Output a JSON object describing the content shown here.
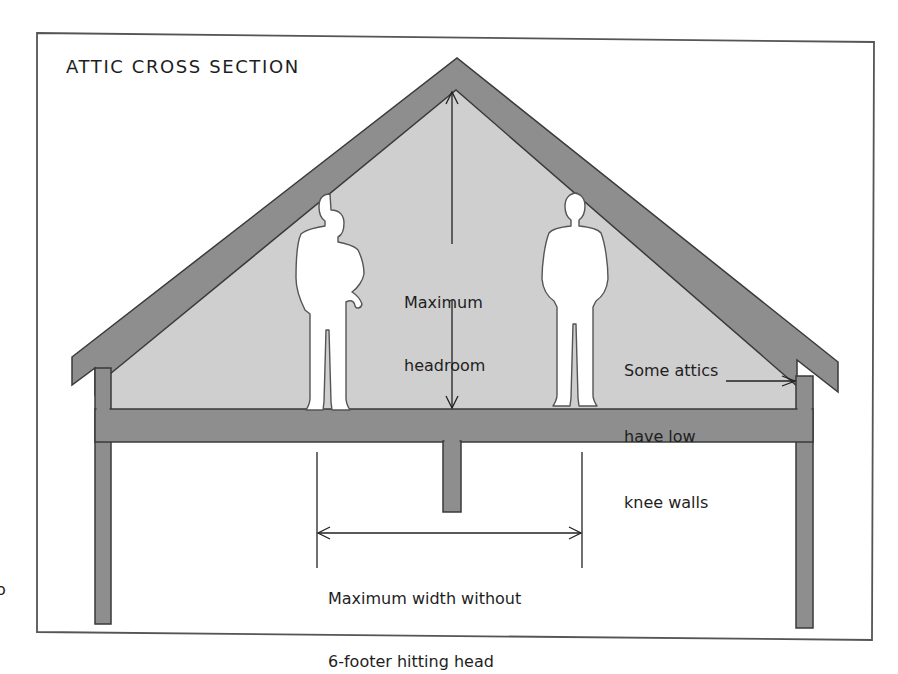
{
  "figure": {
    "title": "ATTIC CROSS SECTION",
    "colors": {
      "background": "#ffffff",
      "border": "#555555",
      "structure_fill": "#8e8e8e",
      "structure_outline": "#3a3a3a",
      "attic_space_fill": "#cfcfcf",
      "person_fill": "#ffffff",
      "person_outline": "#555555",
      "line": "#222222",
      "text": "#1e1e1e"
    }
  },
  "annotations": {
    "headroom": {
      "line1": "Maximum",
      "line2": "headroom"
    },
    "knee_walls": {
      "line1": "Some attics",
      "line2": "have low",
      "line3": "knee walls"
    },
    "max_width": {
      "line1": "Maximum width without",
      "line2": "6-footer hitting head"
    }
  },
  "figures": [
    {
      "name": "standing person left"
    },
    {
      "name": "standing person right"
    }
  ],
  "stray_glyph": "o"
}
